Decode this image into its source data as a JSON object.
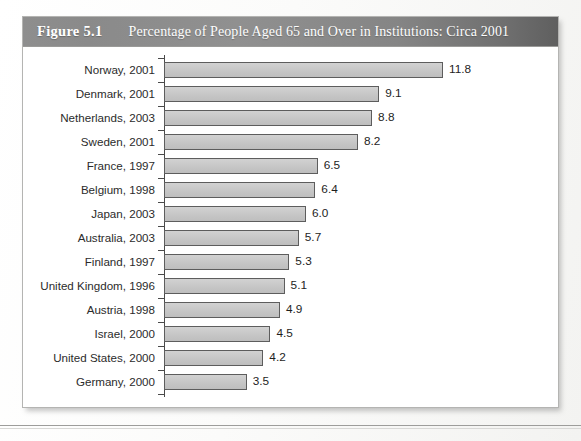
{
  "figure": {
    "number": "Figure 5.1",
    "title": "Percentage of People Aged 65 and Over in Institutions: Circa 2001"
  },
  "chart_data": {
    "type": "bar",
    "orientation": "horizontal",
    "title": "Percentage of People Aged 65 and Over in Institutions: Circa 2001",
    "xlabel": "",
    "ylabel": "",
    "xlim": [
      0,
      11.8
    ],
    "grid": false,
    "legend": false,
    "value_format": "one-decimal",
    "categories": [
      "Norway, 2001",
      "Denmark, 2001",
      "Netherlands, 2003",
      "Sweden, 2001",
      "France, 1997",
      "Belgium, 1998",
      "Japan, 2003",
      "Australia, 2003",
      "Finland, 1997",
      "United Kingdom, 1996",
      "Austria, 1998",
      "Israel, 2000",
      "United States, 2000",
      "Germany, 2000"
    ],
    "values": [
      11.8,
      9.1,
      8.8,
      8.2,
      6.5,
      6.4,
      6.0,
      5.7,
      5.3,
      5.1,
      4.9,
      4.5,
      4.2,
      3.5
    ],
    "value_labels": [
      "11.8",
      "9.1",
      "8.8",
      "8.2",
      "6.5",
      "6.4",
      "6.0",
      "5.7",
      "5.3",
      "5.1",
      "4.9",
      "4.5",
      "4.2",
      "3.5"
    ],
    "colors": {
      "bar_fill": "#c6c6c6",
      "bar_border": "#5d5d5d",
      "axis": "#4a4a4a",
      "title_band": "#8a8a8a",
      "title_text": "#ffffff",
      "label_text": "#2b2b2b",
      "panel": "#ffffff"
    }
  }
}
